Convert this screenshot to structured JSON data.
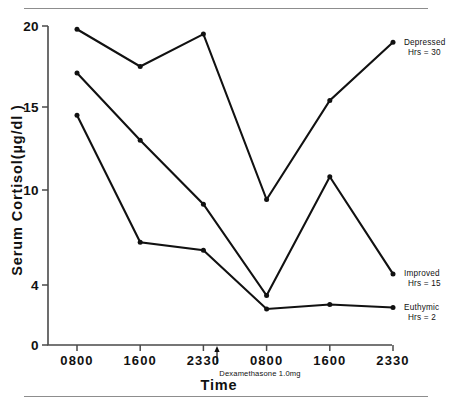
{
  "figure": {
    "has_top_rule": true,
    "has_bottom_rule": true,
    "background_color": "#ffffff",
    "ink_color": "#111111",
    "rule_color": "#8d8d8d"
  },
  "axes": {
    "y_title": "Serum Cortisol(µg/dl )",
    "x_title": "Time",
    "y_ticks": [
      "20",
      "15",
      "10",
      "4",
      "0"
    ],
    "x_ticks": [
      "0800",
      "1600",
      "2330",
      "0800",
      "1600",
      "2330"
    ]
  },
  "annotation": {
    "label": "Dexamethasone  1.0mg",
    "marker": "up-arrow",
    "position_between_ticks": "2330 and 0800"
  },
  "legend": [
    {
      "name": "Depressed",
      "sub": "Hrs = 30"
    },
    {
      "name": "Improved",
      "sub": "Hrs = 15"
    },
    {
      "name": "Euthymic",
      "sub": "Hrs = 2"
    }
  ],
  "chart_data": {
    "type": "line",
    "title": "",
    "subtitle": "",
    "xlabel": "Time",
    "ylabel": "Serum Cortisol(µg/dl )",
    "x": [
      "0800",
      "1600",
      "2330",
      "0800",
      "1600",
      "2330"
    ],
    "ytick_values": [
      20,
      15,
      10,
      4,
      0
    ],
    "ylim": [
      0,
      20
    ],
    "y_scale": "piecewise-linear (irregular tick spacing: 0,4,10,15,20)",
    "grid": false,
    "legend_position": "right-inline-end-of-line",
    "markers": "filled circles",
    "annotations": [
      {
        "text": "Dexamethasone  1.0mg",
        "x_between": [
          "2330",
          "0800"
        ],
        "arrow": "up"
      }
    ],
    "series": [
      {
        "name": "Depressed",
        "sub_label": "Hrs = 30",
        "values": [
          19.8,
          17.5,
          19.5,
          9.4,
          15.4,
          19.0
        ]
      },
      {
        "name": "Improved",
        "sub_label": "Hrs = 15",
        "values": [
          17.1,
          13.0,
          9.1,
          3.3,
          10.8,
          4.7
        ]
      },
      {
        "name": "Euthymic",
        "sub_label": "Hrs = 2",
        "values": [
          14.5,
          6.7,
          6.2,
          2.4,
          2.7,
          2.5
        ]
      }
    ]
  }
}
